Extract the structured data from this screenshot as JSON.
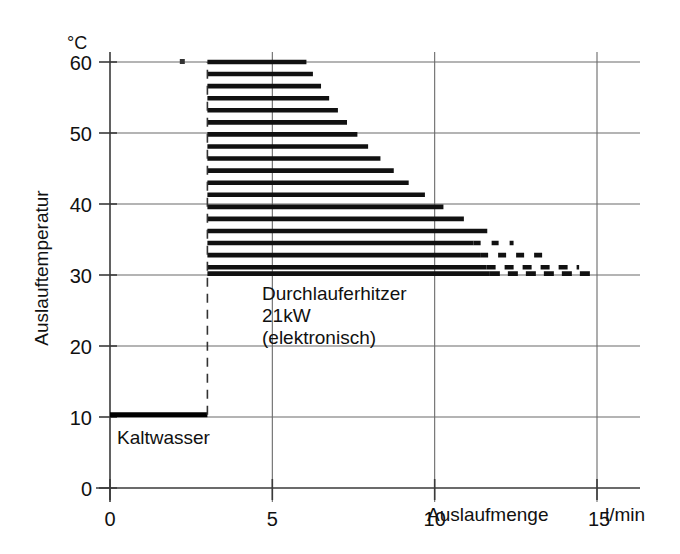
{
  "chart_data": {
    "type": "area",
    "title": "",
    "subtitle": "",
    "xlabel": "Auslaufmenge",
    "xunit": "l/min",
    "ylabel": "Auslauftemperatur",
    "yunit": "°C",
    "xlim": [
      0,
      15
    ],
    "ylim": [
      0,
      60
    ],
    "xticks": [
      0,
      5,
      10,
      15
    ],
    "xticklabels": [
      "0",
      "5",
      "10",
      "15"
    ],
    "yticks": [
      0,
      10,
      20,
      30,
      40,
      50,
      60
    ],
    "yticklabels": [
      "0",
      "10",
      "20",
      "30",
      "40",
      "50",
      "60"
    ],
    "grid": true,
    "grid_axis": "both",
    "legend": "none",
    "annotations": [
      {
        "id": "device",
        "lines": [
          "Durchlauferhitzer",
          "21kW",
          "(elektronisch)"
        ],
        "x": 4.15,
        "y": 26.5
      },
      {
        "id": "cold-water",
        "lines": [
          "Kaltwasser"
        ],
        "x": 0.55,
        "y": 7.2
      }
    ],
    "series": [
      {
        "name": "Kaltwasser",
        "type": "line",
        "style": "solid-thick",
        "points": [
          {
            "x": 0.0,
            "y": 10.3
          },
          {
            "x": 3.0,
            "y": 10.3
          }
        ]
      },
      {
        "name": "Durchlauferhitzer 21kW (elektronisch) Betriebsbereich",
        "type": "hatched-region",
        "style": "horizontal-bars",
        "x_start": 3.0,
        "inlet_temperature": 10.3,
        "power_kw": 21,
        "note": "Rechte Begrenzung folgt der Hyperbel: Auslaufmenge = 21kW / (0.0698 * (T - 10.3))",
        "bars": [
          {
            "y": 60.0,
            "x0": 3.0,
            "x1": 6.05,
            "dashed_from": null
          },
          {
            "y": 58.3,
            "x0": 3.0,
            "x1": 6.25,
            "dashed_from": null
          },
          {
            "y": 56.6,
            "x0": 3.0,
            "x1": 6.5,
            "dashed_from": null
          },
          {
            "y": 54.9,
            "x0": 3.0,
            "x1": 6.75,
            "dashed_from": null
          },
          {
            "y": 53.2,
            "x0": 3.0,
            "x1": 7.02,
            "dashed_from": null
          },
          {
            "y": 51.5,
            "x0": 3.0,
            "x1": 7.3,
            "dashed_from": null
          },
          {
            "y": 49.8,
            "x0": 3.0,
            "x1": 7.62,
            "dashed_from": null
          },
          {
            "y": 48.1,
            "x0": 3.0,
            "x1": 7.95,
            "dashed_from": null
          },
          {
            "y": 46.4,
            "x0": 3.0,
            "x1": 8.33,
            "dashed_from": null
          },
          {
            "y": 44.7,
            "x0": 3.0,
            "x1": 8.74,
            "dashed_from": null
          },
          {
            "y": 43.0,
            "x0": 3.0,
            "x1": 9.2,
            "dashed_from": null
          },
          {
            "y": 41.3,
            "x0": 3.0,
            "x1": 9.7,
            "dashed_from": null
          },
          {
            "y": 39.6,
            "x0": 3.0,
            "x1": 10.27,
            "dashed_from": null
          },
          {
            "y": 37.9,
            "x0": 3.0,
            "x1": 10.9,
            "dashed_from": null
          },
          {
            "y": 36.2,
            "x0": 3.0,
            "x1": 11.62,
            "dashed_from": null
          },
          {
            "y": 34.5,
            "x0": 3.0,
            "x1": 12.43,
            "dashed_from": 11.2
          },
          {
            "y": 32.8,
            "x0": 3.0,
            "x1": 13.37,
            "dashed_from": 11.4
          },
          {
            "y": 31.1,
            "x0": 3.0,
            "x1": 14.45,
            "dashed_from": 11.6
          },
          {
            "y": 30.2,
            "x0": 3.0,
            "x1": 15.0,
            "dashed_from": 11.7
          }
        ]
      },
      {
        "name": "Einschaltgrenze",
        "type": "line",
        "style": "dashed-vertical",
        "points": [
          {
            "x": 3.0,
            "y": 10.3
          },
          {
            "x": 3.0,
            "y": 60.0
          }
        ]
      }
    ]
  },
  "axes": {
    "y_unit_label": "°C",
    "y_title": "Auslauftemperatur",
    "x_title": "Auslaufmenge",
    "x_unit_label": "l/min",
    "x_last_tick_label": "15"
  },
  "annotations": {
    "device_line1": "Durchlauferhitzer",
    "device_line2": "21kW",
    "device_line3": "(elektronisch)",
    "cold_water": "Kaltwasser"
  }
}
